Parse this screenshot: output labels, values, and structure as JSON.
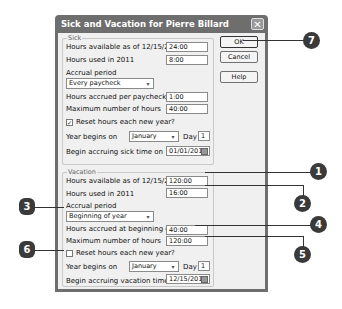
{
  "dialog": {
    "title": "Sick and Vacation for Pierre Billard",
    "buttons": {
      "ok": "OK",
      "cancel": "Cancel",
      "help": "Help"
    }
  },
  "sick": {
    "group_label": "Sick",
    "hours_available_label": "Hours available as of 12/15/2011",
    "hours_available_value": "24:00",
    "hours_used_label": "Hours used in 2011",
    "hours_used_value": "8:00",
    "accrual_period_label": "Accrual period",
    "accrual_period_value": "Every paycheck",
    "hours_accrued_label": "Hours accrued per paycheck",
    "hours_accrued_value": "1:00",
    "max_hours_label": "Maximum number of hours",
    "max_hours_value": "40:00",
    "reset_label": "Reset hours each new year?",
    "reset_checked": true,
    "reset_mark": "✓",
    "year_begins_label": "Year begins on",
    "year_begins_month": "January",
    "day_label": "Day",
    "day_value": "1",
    "begin_accruing_label": "Begin accruing sick time on",
    "begin_accruing_value": "01/01/2011"
  },
  "vacation": {
    "group_label": "Vacation",
    "hours_available_label": "Hours available as of 12/15/2011",
    "hours_available_value": "120:00",
    "hours_used_label": "Hours used in 2011",
    "hours_used_value": "16:00",
    "accrual_period_label": "Accrual period",
    "accrual_period_value": "Beginning of year",
    "hours_accrued_label": "Hours accrued at beginning of year",
    "hours_accrued_value": "40:00",
    "max_hours_label": "Maximum number of hours",
    "max_hours_value": "120:00",
    "reset_label": "Reset hours each new year?",
    "reset_checked": false,
    "reset_mark": "",
    "year_begins_label": "Year begins on",
    "year_begins_month": "January",
    "day_label": "Day",
    "day_value": "1",
    "begin_accruing_label": "Begin accruing vacation time on",
    "begin_accruing_value": "12/15/2011"
  },
  "callouts": [
    "1",
    "2",
    "3",
    "4",
    "5",
    "6",
    "7"
  ],
  "icons": {
    "dropdown": "▾",
    "close": "✕"
  }
}
